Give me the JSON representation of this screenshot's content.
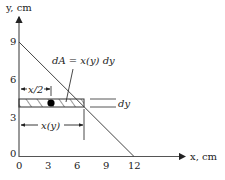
{
  "diagram": {
    "type": "triangle-area-element",
    "axes": {
      "x_label": "x, cm",
      "y_label": "y, cm",
      "x_ticks": [
        "0",
        "3",
        "6",
        "9",
        "12"
      ],
      "y_ticks": [
        "0",
        "3",
        "6",
        "9"
      ]
    },
    "triangle": {
      "vertices": [
        [
          0,
          0
        ],
        [
          12,
          0
        ],
        [
          0,
          9
        ]
      ]
    },
    "annotations": {
      "area_element": "dA = x(y) dy",
      "half_width": "x/2",
      "width": "x(y)",
      "thickness": "dy"
    },
    "colors": {
      "line": "#333333",
      "text": "#222222",
      "centroid_dot": "#000000"
    }
  }
}
